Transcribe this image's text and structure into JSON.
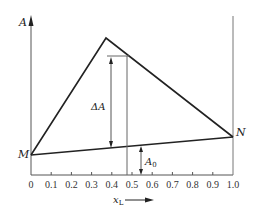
{
  "diagram": {
    "y_axis_label": "A",
    "x_axis_label_main": "x",
    "x_axis_label_sub": "L",
    "point_left": "M",
    "point_right": "N",
    "delta_label": "ΔA",
    "baseline_label_main": "A",
    "baseline_label_sub": "0",
    "x_ticks": [
      "0",
      "0.1",
      "0.2",
      "0.3",
      "0.4",
      "0.5",
      "0.6",
      "0.7",
      "0.8",
      "0.9",
      "1.0"
    ],
    "colors": {
      "line": "#222222",
      "axis": "#555555",
      "background": "#ffffff"
    }
  }
}
